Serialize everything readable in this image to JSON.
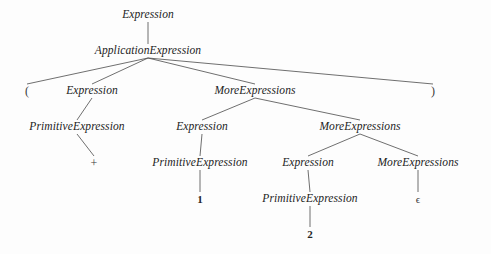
{
  "figure": {
    "type": "parse-tree",
    "title": "",
    "background_color": "#fdfdfd",
    "edge_color": "#4a4a4a",
    "text_color": "#1c1c1c",
    "width": 491,
    "height": 254
  },
  "nodes": [
    {
      "id": "n0",
      "label": "Expression",
      "kind": "nonterminal",
      "x": 148,
      "y": 15,
      "level": 1
    },
    {
      "id": "n1",
      "label": "ApplicationExpression",
      "kind": "nonterminal",
      "x": 148,
      "y": 51,
      "level": 2
    },
    {
      "id": "n2",
      "label": "(",
      "kind": "terminal-punct",
      "x": 27,
      "y": 91,
      "level": 3
    },
    {
      "id": "n3",
      "label": "Expression",
      "kind": "nonterminal",
      "x": 92,
      "y": 91,
      "level": 3
    },
    {
      "id": "n4",
      "label": "MoreExpressions",
      "kind": "nonterminal",
      "x": 255,
      "y": 91,
      "level": 3
    },
    {
      "id": "n5",
      "label": ")",
      "kind": "terminal-punct",
      "x": 433,
      "y": 91,
      "level": 3
    },
    {
      "id": "n6",
      "label": "PrimitiveExpression",
      "kind": "nonterminal",
      "x": 77,
      "y": 127,
      "level": 4
    },
    {
      "id": "n7",
      "label": "Expression",
      "kind": "nonterminal",
      "x": 202,
      "y": 127,
      "level": 4
    },
    {
      "id": "n8",
      "label": "MoreExpressions",
      "kind": "nonterminal",
      "x": 360,
      "y": 127,
      "level": 4
    },
    {
      "id": "n9",
      "label": "+",
      "kind": "terminal-punct",
      "x": 94,
      "y": 163,
      "level": 5
    },
    {
      "id": "n10",
      "label": "PrimitiveExpression",
      "kind": "nonterminal",
      "x": 200,
      "y": 163,
      "level": 5
    },
    {
      "id": "n11",
      "label": "Expression",
      "kind": "nonterminal",
      "x": 308,
      "y": 163,
      "level": 5
    },
    {
      "id": "n12",
      "label": "MoreExpressions",
      "kind": "nonterminal",
      "x": 418,
      "y": 163,
      "level": 5
    },
    {
      "id": "n13",
      "label": "1",
      "kind": "terminal",
      "x": 200,
      "y": 199,
      "level": 6
    },
    {
      "id": "n14",
      "label": "PrimitiveExpression",
      "kind": "nonterminal",
      "x": 310,
      "y": 199,
      "level": 6
    },
    {
      "id": "n15",
      "label": "ϵ",
      "kind": "epsilon",
      "x": 418,
      "y": 199,
      "level": 6
    },
    {
      "id": "n16",
      "label": "2",
      "kind": "terminal",
      "x": 310,
      "y": 234,
      "level": 7
    }
  ],
  "edges": [
    {
      "from": "n0",
      "to": "n1"
    },
    {
      "from": "n1",
      "to": "n2"
    },
    {
      "from": "n1",
      "to": "n3"
    },
    {
      "from": "n1",
      "to": "n4"
    },
    {
      "from": "n1",
      "to": "n5"
    },
    {
      "from": "n3",
      "to": "n6"
    },
    {
      "from": "n4",
      "to": "n7"
    },
    {
      "from": "n4",
      "to": "n8"
    },
    {
      "from": "n6",
      "to": "n9"
    },
    {
      "from": "n7",
      "to": "n10"
    },
    {
      "from": "n8",
      "to": "n11"
    },
    {
      "from": "n8",
      "to": "n12"
    },
    {
      "from": "n10",
      "to": "n13"
    },
    {
      "from": "n11",
      "to": "n14"
    },
    {
      "from": "n12",
      "to": "n15"
    },
    {
      "from": "n14",
      "to": "n16"
    }
  ]
}
